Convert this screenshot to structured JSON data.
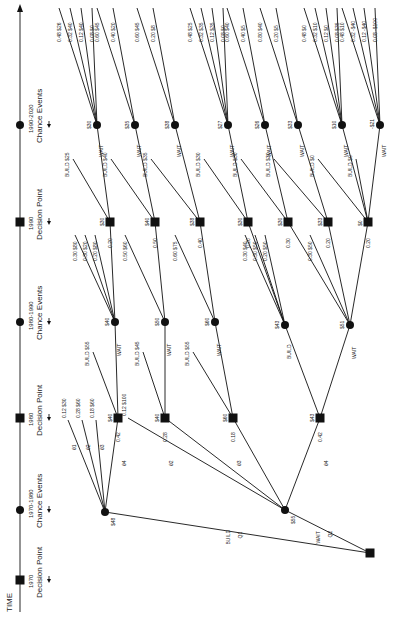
{
  "timeline": {
    "start_label": "TIME",
    "stages": [
      {
        "year": "1970",
        "label": "Decision Point",
        "type": "decision",
        "y": 580
      },
      {
        "year": "1970-1980",
        "label": "Chance Events",
        "type": "chance",
        "y": 510
      },
      {
        "year": "1980",
        "label": "Decision Point",
        "type": "decision",
        "y": 418
      },
      {
        "year": "1980-1990",
        "label": "Chance Events",
        "type": "chance",
        "y": 322
      },
      {
        "year": "1990",
        "label": "Decision Point",
        "type": "decision",
        "y": 222
      },
      {
        "year": "1990-2020",
        "label": "Chance Events",
        "type": "chance",
        "y": 125
      }
    ]
  },
  "root": {
    "x": 370,
    "y": 553,
    "branches": [
      {
        "label": "BUILD",
        "prob": "Q1",
        "to": "c1"
      },
      {
        "label": "WAIT",
        "prob": "Q2",
        "to": "c2"
      }
    ]
  },
  "chance_1970": [
    {
      "id": "c1",
      "x": 105,
      "y": 512,
      "value": "$48"
    },
    {
      "id": "c2",
      "x": 285,
      "y": 510,
      "value": "$55"
    }
  ],
  "decision_1980": [
    {
      "id": "d1",
      "x": 118,
      "y": 418,
      "value": "$40",
      "from": "c1",
      "prob": "0.42",
      "theta": "θ4"
    },
    {
      "id": "d2",
      "x": 165,
      "y": 418,
      "value": "$40",
      "from": "c2",
      "prob": "0.28",
      "theta": "θ2"
    },
    {
      "id": "d3",
      "x": 233,
      "y": 418,
      "value": "$60",
      "from": "c2",
      "prob": "0.18",
      "theta": "θ3"
    },
    {
      "id": "d4",
      "x": 320,
      "y": 418,
      "value": "$43",
      "from": "c2",
      "prob": "0.42",
      "theta": "θ4"
    }
  ],
  "c1_terminals": [
    {
      "theta": "θ1",
      "prob": "0.12",
      "value": "$30"
    },
    {
      "theta": "θ2",
      "prob": "0.28",
      "value": "$60"
    },
    {
      "theta": "θ3",
      "prob": "0.18",
      "value": "$60"
    }
  ],
  "c2_terminals": [
    {
      "theta": "θ1",
      "prob": "0.12",
      "value": "$100"
    }
  ],
  "chance_1980": [
    {
      "id": "e1",
      "x": 115,
      "y": 322,
      "value": "$40",
      "from": "d1",
      "action": "WAIT",
      "build_value": "$55"
    },
    {
      "id": "e2",
      "x": 165,
      "y": 322,
      "value": "$50",
      "from": "d2",
      "action": "WAIT",
      "build_value": "$45"
    },
    {
      "id": "e3",
      "x": 215,
      "y": 322,
      "value": "$60",
      "from": "d3",
      "action": "WAIT",
      "build_value": "$55"
    },
    {
      "id": "e4",
      "x": 285,
      "y": 325,
      "value": "$43",
      "from": "d4",
      "action": "BUILD"
    },
    {
      "id": "e5",
      "x": 350,
      "y": 325,
      "value": "$51",
      "from": "d4",
      "action": "WAIT"
    }
  ],
  "chance_1980_branches": {
    "e1": [
      {
        "theta": "θ1",
        "prob": "0.30",
        "value": "$80",
        "to": null
      },
      {
        "theta": "θ2",
        "prob": "0.30",
        "value": "$20",
        "to": null
      },
      {
        "theta": "θ3",
        "prob": "0.20",
        "value": "$80",
        "to": null
      },
      {
        "theta": "θ4",
        "prob": "0.20",
        "value": "",
        "to": "f1"
      }
    ],
    "e2": [
      {
        "theta": "θ1",
        "prob": "0.50",
        "value": "$60",
        "to": null
      },
      {
        "theta": "θ2",
        "prob": "0.50",
        "value": "",
        "to": "f2"
      }
    ],
    "e3": [
      {
        "theta": "θ1",
        "prob": "0.60",
        "value": "$75",
        "to": null
      },
      {
        "theta": "θ2",
        "prob": "0.40",
        "value": "",
        "to": "f3"
      }
    ],
    "e4": [
      {
        "theta": "θ1",
        "prob": "0.30",
        "value": "$40",
        "to": null
      },
      {
        "theta": "θ2",
        "prob": "0.30",
        "value": "$50",
        "to": null
      },
      {
        "theta": "θ3",
        "prob": "0.20",
        "value": "$50",
        "to": null
      },
      {
        "theta": "θ4",
        "prob": "0.20",
        "value": "",
        "to": "f4"
      }
    ],
    "e5": [
      {
        "theta": "θ1",
        "prob": "0.30",
        "value": "$50",
        "to": null
      },
      {
        "theta": "θ2",
        "prob": "0.30",
        "value": "",
        "to": "f5"
      },
      {
        "theta": "θ3",
        "prob": "0.20",
        "value": "",
        "to": "f6"
      },
      {
        "theta": "θ4",
        "prob": "0.20",
        "value": "",
        "to": "f7"
      }
    ]
  },
  "decision_1990": [
    {
      "id": "f1",
      "x": 110,
      "y": 222,
      "value": "$30",
      "build_value": "$25",
      "wait_value": "$30"
    },
    {
      "id": "f2",
      "x": 155,
      "y": 222,
      "value": "$40",
      "build_value": "$40",
      "wait_value": "$35"
    },
    {
      "id": "f3",
      "x": 200,
      "y": 222,
      "value": "$38",
      "build_value": "$35",
      "wait_value": "$38"
    },
    {
      "id": "f4",
      "x": 248,
      "y": 222,
      "value": "$30",
      "build_value": "$30",
      "wait_value": "$27"
    },
    {
      "id": "f5",
      "x": 288,
      "y": 222,
      "value": "$30",
      "build_value": "$30",
      "wait_value": "$26"
    },
    {
      "id": "f6",
      "x": 328,
      "y": 222,
      "value": "$33",
      "build_value": "$30",
      "wait_value": "$33"
    },
    {
      "id": "f7",
      "x": 368,
      "y": 222,
      "value": "$0",
      "build_value": "$0",
      "wait_value": "-$21"
    }
  ],
  "chance_1990": [
    {
      "id": "g1",
      "x": 97,
      "y": 125,
      "value": "$30",
      "branches": [
        {
          "theta": "θ1",
          "prob": "0.48",
          "value": "$26"
        },
        {
          "theta": "θ2",
          "prob": "0.32",
          "value": "$40"
        },
        {
          "theta": "θ3",
          "prob": "0.12",
          "value": "$40"
        },
        {
          "theta": "θ4",
          "prob": "0.08",
          "value": "$0"
        }
      ]
    },
    {
      "id": "g2",
      "x": 135,
      "y": 125,
      "value": "$35",
      "branches": [
        {
          "theta": "θ1",
          "prob": "0.60",
          "value": "$45"
        },
        {
          "theta": "θ2",
          "prob": "0.40",
          "value": "$20"
        }
      ]
    },
    {
      "id": "g3",
      "x": 175,
      "y": 125,
      "value": "$38",
      "branches": [
        {
          "theta": "θ1",
          "prob": "0.60",
          "value": "$45"
        },
        {
          "theta": "θ2",
          "prob": "0.20",
          "value": "$8"
        }
      ]
    },
    {
      "id": "g4",
      "x": 228,
      "y": 125,
      "value": "$27",
      "branches": [
        {
          "theta": "θ1",
          "prob": "0.48",
          "value": "$25"
        },
        {
          "theta": "θ2",
          "prob": "0.32",
          "value": "$35"
        },
        {
          "theta": "θ3",
          "prob": "0.12",
          "value": "$35"
        },
        {
          "theta": "θ4",
          "prob": "0.08",
          "value": "$0"
        }
      ]
    },
    {
      "id": "g5",
      "x": 265,
      "y": 125,
      "value": "$26",
      "branches": [
        {
          "theta": "θ1",
          "prob": "0.60",
          "value": "$40"
        },
        {
          "theta": "θ2",
          "prob": "0.40",
          "value": "$5"
        }
      ]
    },
    {
      "id": "g6",
      "x": 298,
      "y": 125,
      "value": "$33",
      "branches": [
        {
          "theta": "θ1",
          "prob": "0.80",
          "value": "$40"
        },
        {
          "theta": "θ2",
          "prob": "0.20",
          "value": "$5"
        }
      ]
    },
    {
      "id": "g7",
      "x": 342,
      "y": 125,
      "value": "$10",
      "branches": [
        {
          "theta": "θ1",
          "prob": "0.48",
          "value": "$0"
        },
        {
          "theta": "θ2",
          "prob": "0.32",
          "value": "$10"
        },
        {
          "theta": "θ3",
          "prob": "0.12",
          "value": "$0"
        },
        {
          "theta": "θ4",
          "prob": "0.08",
          "value": "$35"
        }
      ]
    },
    {
      "id": "g8",
      "x": 380,
      "y": 125,
      "value": "-$21",
      "branches": [
        {
          "theta": "θ1",
          "prob": "0.48",
          "value": "$10"
        },
        {
          "theta": "θ2",
          "prob": "0.32",
          "value": "-$40"
        },
        {
          "theta": "θ3",
          "prob": "0.12",
          "value": "-$40"
        },
        {
          "theta": "θ4",
          "prob": "0.08",
          "value": "-$100"
        }
      ]
    }
  ],
  "labels": {
    "build": "BUILD",
    "wait": "WAIT",
    "q1": "Q1",
    "q2": "Q2"
  }
}
